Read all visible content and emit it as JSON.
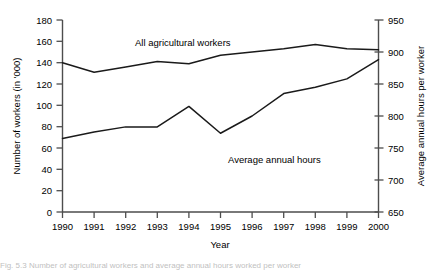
{
  "chart_data": {
    "type": "line",
    "title": "",
    "xlabel": "Year",
    "ylabel": "Number of workers (in '000)",
    "y2label": "Average annual hours per worker",
    "categories": [
      "1990",
      "1991",
      "1992",
      "1993",
      "1994",
      "1995",
      "1996",
      "1997",
      "1998",
      "1999",
      "2000"
    ],
    "x": [
      1990,
      1991,
      1992,
      1993,
      1994,
      1995,
      1996,
      1997,
      1998,
      1999,
      2000
    ],
    "ylim": [
      0,
      180
    ],
    "yticks": [
      0,
      20,
      40,
      60,
      80,
      100,
      120,
      140,
      160,
      180
    ],
    "y2lim": [
      650,
      950
    ],
    "y2ticks": [
      650,
      700,
      750,
      800,
      850,
      900,
      950
    ],
    "grid": false,
    "legend_position": "inline-annotation",
    "series": [
      {
        "name": "All agricultural workers",
        "axis": "left",
        "unit": "thousands",
        "values": [
          140,
          131,
          136,
          141,
          139,
          147,
          150,
          153,
          157,
          153,
          152
        ]
      },
      {
        "name": "Average annual hours",
        "axis": "right",
        "unit": "hours per worker",
        "values": [
          765,
          775,
          783,
          783,
          815,
          773,
          800,
          835,
          845,
          858,
          888
        ]
      }
    ],
    "annotations": [
      {
        "text": "All agricultural workers",
        "x": 1994.0,
        "y_px": 46
      },
      {
        "text": "Average annual hours",
        "x": 1997.1,
        "y_px": 160
      }
    ]
  },
  "axes": {
    "left": {
      "title": "Number of workers (in '000)",
      "ticks": [
        "180",
        "160",
        "140",
        "120",
        "100",
        "80",
        "60",
        "40",
        "20",
        "0"
      ]
    },
    "right": {
      "title": "Average annual hours per worker",
      "ticks": [
        "950",
        "900",
        "850",
        "800",
        "750",
        "700",
        "650"
      ]
    },
    "bottom": {
      "title": "Year",
      "ticks": [
        "1990",
        "1991",
        "1992",
        "1993",
        "1994",
        "1995",
        "1996",
        "1997",
        "1998",
        "1999",
        "2000"
      ]
    }
  },
  "series_labels": {
    "workers": "All agricultural workers",
    "hours": "Average annual hours"
  },
  "caption": {
    "text": "Fig. 5.3  Number of agricultural workers and average annual hours worked per worker"
  },
  "colors": {
    "line": "#1a1a1a",
    "axis": "#4d4d4d",
    "text": "#000000",
    "background": "#ffffff"
  }
}
